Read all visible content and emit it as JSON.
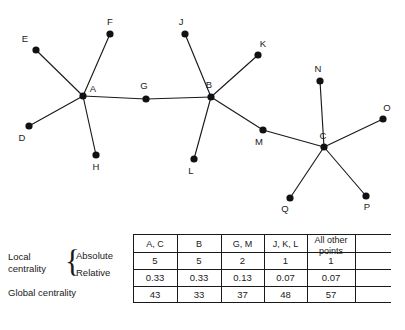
{
  "figure": {
    "graph": {
      "nodes": [
        {
          "id": "E",
          "label": "E",
          "x": 36,
          "y": 50,
          "lx": 25,
          "ly": 42
        },
        {
          "id": "F",
          "label": "F",
          "x": 110,
          "y": 34,
          "lx": 110,
          "ly": 25
        },
        {
          "id": "A",
          "label": "A",
          "x": 83,
          "y": 96,
          "lx": 93,
          "ly": 92
        },
        {
          "id": "D",
          "label": "D",
          "x": 29,
          "y": 126,
          "lx": 22,
          "ly": 141
        },
        {
          "id": "H",
          "label": "H",
          "x": 96,
          "y": 155,
          "lx": 96,
          "ly": 170
        },
        {
          "id": "G",
          "label": "G",
          "x": 146,
          "y": 99,
          "lx": 144,
          "ly": 89
        },
        {
          "id": "J",
          "label": "J",
          "x": 185,
          "y": 34,
          "lx": 181,
          "ly": 25
        },
        {
          "id": "B",
          "label": "B",
          "x": 211,
          "y": 97,
          "lx": 209,
          "ly": 88
        },
        {
          "id": "K",
          "label": "K",
          "x": 258,
          "y": 55,
          "lx": 263,
          "ly": 47
        },
        {
          "id": "L",
          "label": "L",
          "x": 194,
          "y": 159,
          "lx": 191,
          "ly": 174
        },
        {
          "id": "M",
          "label": "M",
          "x": 263,
          "y": 130,
          "lx": 259,
          "ly": 145
        },
        {
          "id": "N",
          "label": "N",
          "x": 320,
          "y": 81,
          "lx": 318,
          "ly": 72
        },
        {
          "id": "C",
          "label": "C",
          "x": 324,
          "y": 147,
          "lx": 323,
          "ly": 139
        },
        {
          "id": "O",
          "label": "O",
          "x": 383,
          "y": 119,
          "lx": 387,
          "ly": 111
        },
        {
          "id": "P",
          "label": "P",
          "x": 366,
          "y": 196,
          "lx": 367,
          "ly": 210
        },
        {
          "id": "Q",
          "label": "Q",
          "x": 290,
          "y": 198,
          "lx": 285,
          "ly": 212
        }
      ],
      "edges": [
        [
          "E",
          "A"
        ],
        [
          "F",
          "A"
        ],
        [
          "D",
          "A"
        ],
        [
          "H",
          "A"
        ],
        [
          "A",
          "G"
        ],
        [
          "G",
          "B"
        ],
        [
          "J",
          "B"
        ],
        [
          "K",
          "B"
        ],
        [
          "L",
          "B"
        ],
        [
          "B",
          "M"
        ],
        [
          "M",
          "C"
        ],
        [
          "N",
          "C"
        ],
        [
          "O",
          "C"
        ],
        [
          "P",
          "C"
        ],
        [
          "Q",
          "C"
        ]
      ]
    },
    "table": {
      "row_group_label": "Local centrality",
      "row_group_label_line1": "Local",
      "row_group_label_line2": "centrality",
      "brace": "{",
      "subrow_absolute": "Absolute",
      "subrow_relative": "Relative",
      "row_global": "Global centrality",
      "columns": [
        "A, C",
        "B",
        "G, M",
        "J, K, L",
        "All other points"
      ],
      "columns_display": [
        {
          "line1": "A, C",
          "line2": ""
        },
        {
          "line1": "B",
          "line2": ""
        },
        {
          "line1": "G, M",
          "line2": ""
        },
        {
          "line1": "J, K, L",
          "line2": ""
        },
        {
          "line1": "All other",
          "line2": "points"
        }
      ],
      "rows": [
        {
          "name": "Absolute",
          "values": [
            "5",
            "5",
            "2",
            "1",
            "1"
          ]
        },
        {
          "name": "Relative",
          "values": [
            "0.33",
            "0.33",
            "0.13",
            "0.07",
            "0.07"
          ]
        },
        {
          "name": "Global centrality",
          "values": [
            "43",
            "33",
            "37",
            "48",
            "57"
          ]
        }
      ]
    }
  },
  "chart_data": {
    "type": "table",
    "title": "",
    "categories": [
      "A, C",
      "B",
      "G, M",
      "J, K, L",
      "All other points"
    ],
    "series": [
      {
        "name": "Local centrality — Absolute",
        "values": [
          5,
          5,
          2,
          1,
          1
        ]
      },
      {
        "name": "Local centrality — Relative",
        "values": [
          0.33,
          0.33,
          0.13,
          0.07,
          0.07
        ]
      },
      {
        "name": "Global centrality",
        "values": [
          43,
          33,
          37,
          48,
          57
        ]
      }
    ],
    "xlabel": "",
    "ylabel": "",
    "grid": true,
    "legend": "none",
    "network": {
      "type": "graph",
      "node_count": 16,
      "nodes": [
        "A",
        "B",
        "C",
        "D",
        "E",
        "F",
        "G",
        "H",
        "J",
        "K",
        "L",
        "M",
        "N",
        "O",
        "P",
        "Q"
      ],
      "edges": [
        [
          "E",
          "A"
        ],
        [
          "F",
          "A"
        ],
        [
          "D",
          "A"
        ],
        [
          "H",
          "A"
        ],
        [
          "A",
          "G"
        ],
        [
          "G",
          "B"
        ],
        [
          "J",
          "B"
        ],
        [
          "K",
          "B"
        ],
        [
          "L",
          "B"
        ],
        [
          "B",
          "M"
        ],
        [
          "M",
          "C"
        ],
        [
          "N",
          "C"
        ],
        [
          "O",
          "C"
        ],
        [
          "P",
          "C"
        ],
        [
          "Q",
          "C"
        ]
      ],
      "degrees": {
        "A": 5,
        "B": 5,
        "C": 5,
        "G": 2,
        "M": 2,
        "D": 1,
        "E": 1,
        "F": 1,
        "H": 1,
        "J": 1,
        "K": 1,
        "L": 1,
        "N": 1,
        "O": 1,
        "P": 1,
        "Q": 1
      }
    }
  }
}
